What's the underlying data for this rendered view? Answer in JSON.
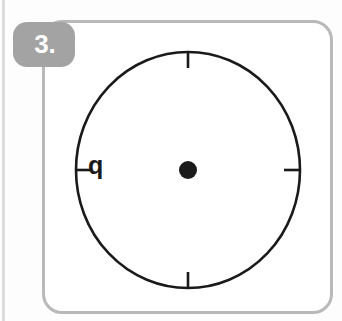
{
  "card": {
    "number_badge": "3.",
    "badge_color": "#a3a3a3",
    "badge_text_color": "#ffffff",
    "frame_color": "#b9b9b9",
    "background_color": "#ffffff"
  },
  "diagram": {
    "type": "circle-with-center-and-tick-marks",
    "stroke_color": "#1a1a1a",
    "center_dot_color": "#1a1a1a",
    "center": {
      "x": 188,
      "y": 170
    },
    "radius_x": 112,
    "radius_y": 118,
    "center_dot_radius": 9,
    "tick_marks": [
      {
        "name": "tick-top",
        "position": "top",
        "length": 14
      },
      {
        "name": "tick-right",
        "position": "right",
        "length": 14
      },
      {
        "name": "tick-bottom",
        "position": "bottom",
        "length": 14
      },
      {
        "name": "tick-left",
        "position": "left",
        "length": 14
      }
    ],
    "labels": [
      {
        "name": "segment-label-q",
        "text": "q",
        "near": "left-tick"
      }
    ]
  }
}
